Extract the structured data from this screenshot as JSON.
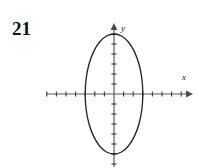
{
  "figure": {
    "problem_number": "21",
    "axis_labels": {
      "x": "x",
      "y": "y"
    },
    "stroke_color": "#2b2b2b",
    "axis_color": "#555555",
    "curve_color": "#262626",
    "background_color": "#ffffff"
  },
  "chart_data": {
    "type": "line",
    "title": "",
    "subtitle": "",
    "xlabel": "x",
    "ylabel": "y",
    "grid": false,
    "legend": "none",
    "curve": "ellipse",
    "center": [
      0,
      0
    ],
    "semi_axis_x": 3,
    "semi_axis_y": 6,
    "equation": "x^2/9 + y^2/36 = 1",
    "xlim": [
      -7.5,
      7.5
    ],
    "ylim": [
      -8,
      8
    ],
    "x_ticks": [
      -7,
      -6,
      -5,
      -4,
      -3,
      -2,
      -1,
      1,
      2,
      3,
      4,
      5,
      6,
      7
    ],
    "y_ticks": [
      -7,
      -6,
      -5,
      -4,
      -3,
      -2,
      -1,
      1,
      2,
      3,
      4,
      5,
      6,
      7
    ],
    "x_tick_labels": [],
    "y_tick_labels": [],
    "x_intercepts": [
      -3,
      3
    ],
    "y_intercepts": [
      -6,
      6
    ],
    "series": [
      {
        "name": "ellipse",
        "points": [
          [
            3.0,
            0.0
          ],
          [
            2.9,
            1.55
          ],
          [
            2.6,
            3.0
          ],
          [
            2.12,
            4.24
          ],
          [
            1.5,
            5.2
          ],
          [
            0.78,
            5.8
          ],
          [
            0.0,
            6.0
          ],
          [
            -0.78,
            5.8
          ],
          [
            -1.5,
            5.2
          ],
          [
            -2.12,
            4.24
          ],
          [
            -2.6,
            3.0
          ],
          [
            -2.9,
            1.55
          ],
          [
            -3.0,
            0.0
          ],
          [
            -2.9,
            -1.55
          ],
          [
            -2.6,
            -3.0
          ],
          [
            -2.12,
            -4.24
          ],
          [
            -1.5,
            -5.2
          ],
          [
            -0.78,
            -5.8
          ],
          [
            0.0,
            -6.0
          ],
          [
            0.78,
            -5.8
          ],
          [
            1.5,
            -5.2
          ],
          [
            2.12,
            -4.24
          ],
          [
            2.6,
            -3.0
          ],
          [
            2.9,
            -1.55
          ],
          [
            3.0,
            0.0
          ]
        ]
      }
    ]
  }
}
